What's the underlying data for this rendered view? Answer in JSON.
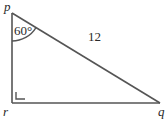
{
  "diagram": {
    "type": "right-triangle",
    "vertices": {
      "p": {
        "label": "p"
      },
      "q": {
        "label": "q"
      },
      "r": {
        "label": "r"
      }
    },
    "angle_p": {
      "label": "60°",
      "degrees": 60
    },
    "right_angle_at": "r",
    "hypotenuse": {
      "from": "p",
      "to": "q",
      "label": "12"
    },
    "colors": {
      "stroke": "#555555",
      "text": "#2a2a2a",
      "background": "#ffffff"
    }
  }
}
